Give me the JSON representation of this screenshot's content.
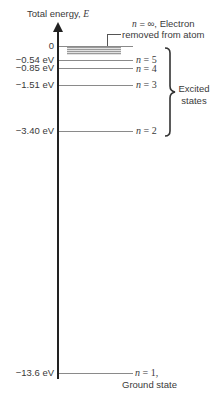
{
  "axis": {
    "label": "Total energy, ",
    "symbol": "E"
  },
  "top_annotation": {
    "line1": "n = ∞, Electron",
    "line2": "removed from atom"
  },
  "levels": [
    {
      "energy": "0",
      "n": "∞",
      "y": 46
    },
    {
      "energy": "−0.54 eV",
      "n": "5",
      "y": 60
    },
    {
      "energy": "−0.85 eV",
      "n": "4",
      "y": 68
    },
    {
      "energy": "−1.51 eV",
      "n": "3",
      "y": 85
    },
    {
      "energy": "−3.40 eV",
      "n": "2",
      "y": 131
    },
    {
      "energy": "−13.6 eV",
      "n": "1,",
      "y": 373
    }
  ],
  "n_prefix": "n",
  "n_eq": " = ",
  "group_label": {
    "line1": "Excited",
    "line2": "states"
  },
  "ground_label": "Ground state",
  "colors": {
    "axis": "#222222",
    "level_line": "#8a8a8a",
    "text": "#3a3a3a"
  }
}
